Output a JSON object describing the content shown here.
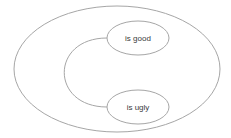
{
  "diagram": {
    "type": "ellipse-relationship",
    "colors": {
      "stroke": "#a6a6a6",
      "text": "#3a3a3a",
      "background": "#ffffff"
    },
    "outer": {
      "label": ""
    },
    "nodes": [
      {
        "id": "good",
        "label": "is good"
      },
      {
        "id": "ugly",
        "label": "is ugly"
      }
    ],
    "edges": [
      {
        "from": "good",
        "to": "ugly",
        "label": ""
      }
    ]
  }
}
